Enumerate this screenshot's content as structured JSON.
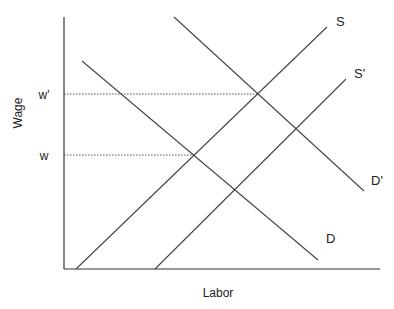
{
  "chart_data": {
    "type": "line",
    "title": "",
    "xlabel": "Labor",
    "ylabel": "Wage",
    "grid": false,
    "legend": "none (curves labeled inline)",
    "axis_ticks": {
      "x": [],
      "y": [
        "w'",
        "w"
      ]
    },
    "colors": {
      "axis": "#333333",
      "curve": "#444444",
      "guide": "#555555",
      "text": "#222222"
    },
    "pixel_frame": {
      "origin": [
        64,
        269
      ],
      "x_end": 380,
      "y_top": 17
    },
    "series": [
      {
        "name": "S",
        "label": "S",
        "kind": "supply",
        "points": [
          [
            76,
            269
          ],
          [
            327,
            27
          ]
        ],
        "label_pos": [
          336,
          26
        ]
      },
      {
        "name": "S'",
        "label": "S'",
        "kind": "supply",
        "points": [
          [
            155,
            269
          ],
          [
            346,
            79
          ]
        ],
        "label_pos": [
          354,
          78
        ]
      },
      {
        "name": "D",
        "label": "D",
        "kind": "demand",
        "points": [
          [
            82,
            61
          ],
          [
            318,
            260
          ]
        ],
        "label_pos": [
          326,
          243
        ]
      },
      {
        "name": "D'",
        "label": "D'",
        "kind": "demand",
        "points": [
          [
            174,
            17
          ],
          [
            364,
            191
          ]
        ],
        "label_pos": [
          371,
          185
        ]
      }
    ],
    "guides": [
      {
        "label": "w'",
        "y": 94,
        "x_to": 258,
        "label_pos": [
          44,
          99
        ],
        "note": "equilibrium S & D'"
      },
      {
        "label": "w",
        "y": 155,
        "x_to": 194,
        "label_pos": [
          44,
          160
        ],
        "note": "equilibrium S & D"
      }
    ]
  }
}
